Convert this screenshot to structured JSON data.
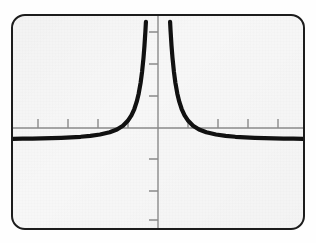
{
  "figure": {
    "border_color": "#1c1c1c",
    "plot_background": "#f7f7f7",
    "page_background": "#fefefe"
  },
  "chart_data": {
    "type": "line",
    "title": "",
    "subtitle": "",
    "xlabel": "",
    "ylabel": "",
    "function_label": "y = 1/x^2",
    "curve_color": "#111111",
    "axis_color": "#8a8a8a",
    "grid": false,
    "legend": null,
    "legend_position": "none",
    "xlim": [
      -6,
      6
    ],
    "ylim": [
      -3,
      4.2
    ],
    "vertical_asymptote": 0,
    "horizontal_asymptote": 0,
    "x_axis_ticks": [
      -5,
      -4,
      -3,
      -2,
      2,
      3,
      4,
      5
    ],
    "y_axis_ticks": [
      -2.5,
      -1.5,
      -0.8,
      1.1,
      2.2,
      3.3
    ],
    "tick_labels_shown": false,
    "series": [
      {
        "name": "left-branch",
        "x": [
          -6.0,
          -5.6,
          -5.2,
          -4.8,
          -4.4,
          -4.0,
          -3.6,
          -3.2,
          -2.8,
          -2.4,
          -2.0,
          -1.7,
          -1.45,
          -1.25,
          -1.1,
          -0.98,
          -0.88,
          -0.8,
          -0.72,
          -0.66,
          -0.6,
          -0.56,
          -0.52,
          -0.5
        ],
        "y": [
          0.028,
          0.032,
          0.037,
          0.043,
          0.052,
          0.063,
          0.077,
          0.098,
          0.128,
          0.174,
          0.25,
          0.346,
          0.476,
          0.64,
          0.826,
          1.041,
          1.291,
          1.563,
          1.929,
          2.296,
          2.778,
          3.189,
          3.698,
          4.0
        ]
      },
      {
        "name": "right-branch",
        "x": [
          0.5,
          0.52,
          0.56,
          0.6,
          0.66,
          0.72,
          0.8,
          0.88,
          0.98,
          1.1,
          1.25,
          1.45,
          1.7,
          2.0,
          2.4,
          2.8,
          3.2,
          3.6,
          4.0,
          4.4,
          4.8,
          5.2,
          5.6,
          6.0
        ],
        "y": [
          4.0,
          3.698,
          3.189,
          2.778,
          2.296,
          1.929,
          1.563,
          1.291,
          1.041,
          0.826,
          0.64,
          0.476,
          0.346,
          0.25,
          0.174,
          0.128,
          0.098,
          0.077,
          0.063,
          0.052,
          0.043,
          0.037,
          0.032,
          0.028
        ]
      }
    ]
  }
}
